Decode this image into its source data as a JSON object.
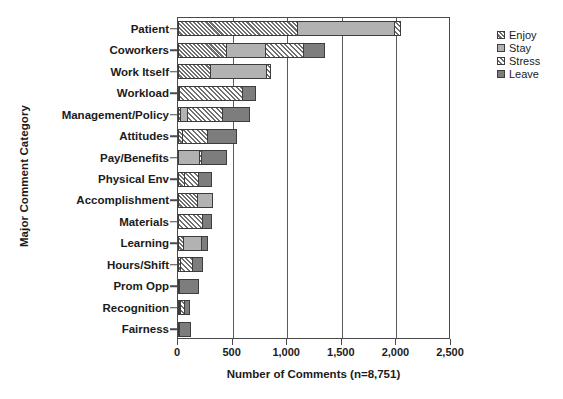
{
  "chart_data": {
    "type": "bar",
    "orientation": "horizontal",
    "stacked": true,
    "title": "",
    "xlabel": "Number of Comments (n=8,751)",
    "ylabel": "Major Comment Category",
    "xlim": [
      0,
      2500
    ],
    "xticks": [
      0,
      500,
      1000,
      1500,
      2000,
      2500
    ],
    "xticklabels": [
      "0",
      "500",
      "1,000",
      "1,500",
      "2,000",
      "2,500"
    ],
    "grid": true,
    "legend_position": "right",
    "categories": [
      "Patient",
      "Coworkers",
      "Work Itself",
      "Workload",
      "Management/Policy",
      "Attitudes",
      "Pay/Benefits",
      "Physical Env",
      "Accomplishment",
      "Materials",
      "Learning",
      "Hours/Shift",
      "Prom Opp",
      "Recognition",
      "Fairness"
    ],
    "series": [
      {
        "name": "Enjoy",
        "color": "#bfbfbf",
        "pattern": "diagonal-hatch",
        "values": [
          1100,
          450,
          300,
          15,
          30,
          45,
          0,
          60,
          180,
          0,
          55,
          25,
          20,
          20,
          20
        ]
      },
      {
        "name": "Stay",
        "color": "#b2b2b2",
        "pattern": "solid-light",
        "values": [
          900,
          365,
          520,
          0,
          75,
          0,
          200,
          0,
          150,
          0,
          175,
          0,
          0,
          20,
          0
        ]
      },
      {
        "name": "Stress",
        "color": "#ffffff",
        "pattern": "cross-hatch",
        "values": [
          60,
          355,
          50,
          585,
          325,
          235,
          30,
          140,
          0,
          230,
          0,
          125,
          0,
          40,
          0
        ]
      },
      {
        "name": "Leave",
        "color": "#7d7d7d",
        "pattern": "solid-dark",
        "values": [
          0,
          205,
          0,
          130,
          260,
          280,
          240,
          130,
          0,
          90,
          60,
          100,
          180,
          55,
          105
        ]
      }
    ],
    "totals": [
      2060,
      1375,
      870,
      730,
      690,
      560,
      470,
      330,
      330,
      320,
      290,
      250,
      200,
      135,
      125
    ]
  },
  "legend": {
    "items": [
      {
        "label": "Enjoy"
      },
      {
        "label": "Stay"
      },
      {
        "label": "Stress"
      },
      {
        "label": "Leave"
      }
    ]
  },
  "caption": ""
}
